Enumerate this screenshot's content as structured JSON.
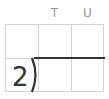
{
  "header": {
    "columns": [
      "",
      "T",
      "U"
    ]
  },
  "division": {
    "divisor": "2",
    "dividend_cells": [
      "",
      ""
    ],
    "quotient_cells": [
      "",
      "",
      ""
    ]
  },
  "colors": {
    "grid_line": "#d6d6d6",
    "division_bar": "#333333",
    "header_text": "#9a9a9a",
    "digit": "#333333"
  }
}
